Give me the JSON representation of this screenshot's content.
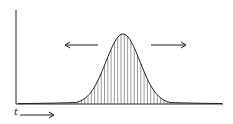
{
  "diagram": {
    "type": "bell-curve",
    "axis_label_x": "t",
    "hatching": "vertical lines under curve",
    "arrows": [
      "left",
      "right"
    ],
    "colors": {
      "stroke": "#222222",
      "hatch": "#555555",
      "background": "#ffffff"
    }
  }
}
